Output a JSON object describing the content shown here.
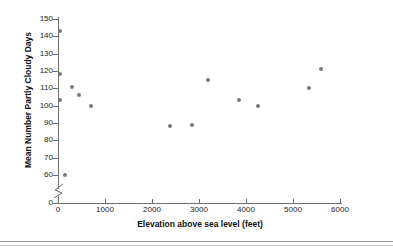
{
  "chart_data": {
    "type": "scatter",
    "title": "",
    "xlabel": "Elevation above sea level (feet)",
    "ylabel": "Mean Number Partly Cloudy Days",
    "xlim": [
      0,
      6000
    ],
    "ylim": [
      0,
      155
    ],
    "grid": false,
    "legend": null,
    "axis_break_y": true,
    "xticks": [
      0,
      1000,
      2000,
      3000,
      4000,
      5000,
      6000
    ],
    "xtick_labels": [
      "0",
      "1000",
      "2000",
      "3000",
      "4000",
      "5000",
      "6000"
    ],
    "yticks": [
      0,
      60,
      70,
      80,
      90,
      100,
      110,
      120,
      130,
      140,
      150
    ],
    "ytick_labels": [
      "0",
      "60",
      "70",
      "80",
      "90",
      "100",
      "110",
      "120",
      "130",
      "140",
      "150"
    ],
    "marker": "filled-circle",
    "marker_color": "#7b7b7b",
    "points": [
      {
        "x": 50,
        "y": 143
      },
      {
        "x": 50,
        "y": 118
      },
      {
        "x": 50,
        "y": 103
      },
      {
        "x": 150,
        "y": 60
      },
      {
        "x": 300,
        "y": 111
      },
      {
        "x": 450,
        "y": 106
      },
      {
        "x": 700,
        "y": 100
      },
      {
        "x": 2380,
        "y": 88
      },
      {
        "x": 2850,
        "y": 89
      },
      {
        "x": 3200,
        "y": 115
      },
      {
        "x": 3850,
        "y": 103
      },
      {
        "x": 4250,
        "y": 100
      },
      {
        "x": 5350,
        "y": 110
      },
      {
        "x": 5600,
        "y": 121
      }
    ]
  },
  "colors": {
    "marker": "#7b7b7b",
    "axis": "#6d6d6d",
    "text": "#111111"
  }
}
